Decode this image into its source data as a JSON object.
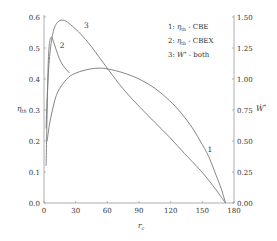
{
  "chart_data": {
    "type": "line",
    "title": "",
    "xlabel": "r_c",
    "ylabel_left": "η_th",
    "ylabel_right": "Ẇ*",
    "xlim": [
      0,
      180
    ],
    "ylim_left": [
      0.0,
      0.6
    ],
    "ylim_right": [
      0.0,
      1.5
    ],
    "x_ticks": [
      "0",
      "30",
      "60",
      "90",
      "120",
      "150",
      "180"
    ],
    "y_ticks_left": [
      "0.0",
      "0.1",
      "0.2",
      "0.3",
      "0.4",
      "0.5",
      "0.6"
    ],
    "y_ticks_right": [
      "0.00",
      "0.25",
      "0.50",
      "0.75",
      "1.00",
      "1.25",
      "1.50"
    ],
    "grid": false,
    "legend": {
      "position": "upper right",
      "entries": [
        {
          "num": "1:",
          "sym": "η",
          "sub": "th",
          "text": " - CBE"
        },
        {
          "num": "2:",
          "sym": "η",
          "sub": "th",
          "text": " - CBEX"
        },
        {
          "num": "3:",
          "sym": "Ẇ",
          "sup": "*",
          "text": " - both"
        }
      ]
    },
    "series": [
      {
        "name": "1: η_th - CBE",
        "axis": "left",
        "label": "1",
        "x": [
          3,
          5,
          8,
          12,
          18,
          25,
          35,
          45,
          53,
          61,
          75,
          90,
          105,
          119,
          130,
          140,
          148,
          156,
          163,
          168,
          172
        ],
        "y": [
          0.2,
          0.25,
          0.3,
          0.35,
          0.385,
          0.41,
          0.425,
          0.433,
          0.435,
          0.432,
          0.42,
          0.4,
          0.37,
          0.33,
          0.29,
          0.245,
          0.2,
          0.15,
          0.09,
          0.045,
          0.0
        ]
      },
      {
        "name": "2: η_th - CBEX",
        "axis": "left",
        "label": "2",
        "x": [
          2,
          3,
          4,
          5,
          6,
          7,
          8,
          10,
          13,
          16,
          20,
          24
        ],
        "y": [
          0.12,
          0.3,
          0.45,
          0.51,
          0.53,
          0.535,
          0.53,
          0.51,
          0.48,
          0.455,
          0.435,
          0.42
        ]
      },
      {
        "name": "3: Ẇ* - both",
        "axis": "right",
        "label": "3",
        "x": [
          2,
          3,
          5,
          8,
          12,
          18,
          25,
          35,
          45,
          61,
          75,
          90,
          105,
          119,
          133,
          148,
          160,
          172
        ],
        "y": [
          0.6,
          0.85,
          1.15,
          1.35,
          1.45,
          1.475,
          1.44,
          1.36,
          1.26,
          1.075,
          0.92,
          0.78,
          0.65,
          0.53,
          0.4,
          0.265,
          0.14,
          0.0
        ]
      }
    ],
    "annotations": [
      {
        "text": "1",
        "x": 155,
        "y_left": 0.165
      },
      {
        "text": "2",
        "x": 15,
        "y_left": 0.5
      },
      {
        "text": "3",
        "x": 38,
        "y_left": 0.565
      }
    ]
  }
}
